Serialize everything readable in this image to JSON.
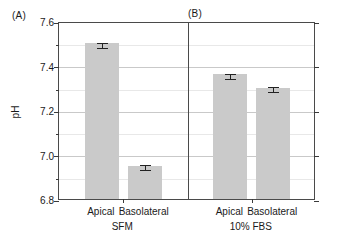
{
  "chart_data": {
    "type": "bar",
    "title": "",
    "xlabel": "",
    "ylabel": "pH",
    "ylim": [
      6.8,
      7.6
    ],
    "ytick_major_step": 0.2,
    "ytick_minor_step": 0.1,
    "ytick_labels": [
      "6.8",
      "7.0",
      "7.2",
      "7.4",
      "7.6"
    ],
    "ytick_values": [
      6.8,
      7.0,
      7.2,
      7.4,
      7.6
    ],
    "grid": true,
    "legend": "none",
    "panels": [
      {
        "letter": "(A)",
        "group_label": "SFM",
        "categories": [
          "Apical",
          "Basolateral"
        ],
        "values": [
          7.5,
          6.95
        ],
        "errors": [
          0.012,
          0.012
        ]
      },
      {
        "letter": "(B)",
        "group_label": "10% FBS",
        "categories": [
          "Apical",
          "Basolateral"
        ],
        "values": [
          7.36,
          7.3
        ],
        "errors": [
          0.012,
          0.012
        ]
      }
    ],
    "categories": [
      "Apical",
      "Basolateral",
      "Apical",
      "Basolateral"
    ],
    "values": [
      7.5,
      6.95,
      7.36,
      7.3
    ],
    "errors": [
      0.012,
      0.012,
      0.012,
      0.012
    ],
    "bar_color": "#cacaca",
    "error_color": "#222222",
    "axis_color": "#4a4a4a",
    "grid_color": "#c9c9c9"
  }
}
